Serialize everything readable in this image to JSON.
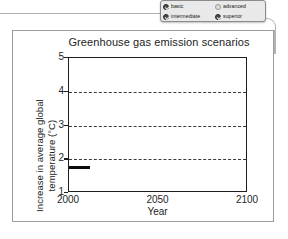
{
  "options_panel": {
    "name": "difficulty-options",
    "items": [
      {
        "label": "basic",
        "icon": "check-circle-filled-icon",
        "selected": true
      },
      {
        "label": "advanced",
        "icon": "circle-empty-icon",
        "selected": false
      },
      {
        "label": "intermediate",
        "icon": "check-circle-filled-icon",
        "selected": true
      },
      {
        "label": "superior",
        "icon": "check-circle-filled-icon",
        "selected": true
      }
    ]
  },
  "chart_data": {
    "type": "line",
    "title": "Greenhouse gas emission scenarios",
    "xlabel": "Year",
    "ylabel": "Increase in average global temperature (°C)",
    "xlim": [
      2000,
      2100
    ],
    "ylim": [
      1,
      5
    ],
    "xticks": [
      2000,
      2050,
      2100
    ],
    "xticklabels": [
      "2000",
      "2050",
      "2100"
    ],
    "yticks": [
      1,
      2,
      3,
      4,
      5
    ],
    "yticklabels": [
      "1",
      "2",
      "3",
      "4",
      "5"
    ],
    "grid": {
      "horizontal_dashed_at": [
        2,
        3,
        4
      ]
    },
    "legend": null,
    "series": [
      {
        "name": "observed",
        "style": "thick-solid-black",
        "x": [
          2000,
          2012
        ],
        "values": [
          1.75,
          1.75
        ]
      }
    ]
  }
}
